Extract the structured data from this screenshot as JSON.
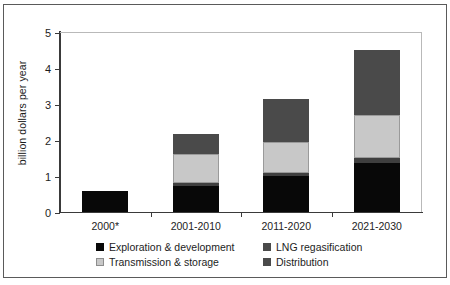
{
  "chart_data": {
    "type": "bar",
    "stacked": true,
    "title": "",
    "xlabel": "",
    "ylabel": "billion dollars per year",
    "ylim": [
      0,
      5
    ],
    "yticks": [
      0,
      1,
      2,
      3,
      4,
      5
    ],
    "ytick_labels": [
      "0",
      "1",
      "2",
      "3",
      "4",
      "5"
    ],
    "grid": false,
    "legend_position": "bottom",
    "categories": [
      "2000*",
      "2001-2010",
      "2011-2020",
      "2021-2030"
    ],
    "series": [
      {
        "name": "Exploration & development",
        "color": "#080808",
        "values": [
          0.57,
          0.72,
          1.0,
          1.35
        ]
      },
      {
        "name": "Distribution",
        "color": "#4a4a4a",
        "values": [
          0.0,
          0.08,
          0.08,
          0.15
        ]
      },
      {
        "name": "Transmission & storage",
        "color": "#c8c8c8",
        "values": [
          0.0,
          0.8,
          0.87,
          1.2
        ]
      },
      {
        "name": "LNG regasification",
        "color": "#4a4a4a",
        "values": [
          0.0,
          0.58,
          1.18,
          1.8
        ]
      }
    ],
    "totals": [
      0.57,
      2.18,
      3.13,
      4.5
    ]
  },
  "legend": {
    "items": [
      {
        "label": "Exploration & development"
      },
      {
        "label": "LNG regasification"
      },
      {
        "label": "Transmission & storage"
      },
      {
        "label": "Distribution"
      }
    ]
  }
}
